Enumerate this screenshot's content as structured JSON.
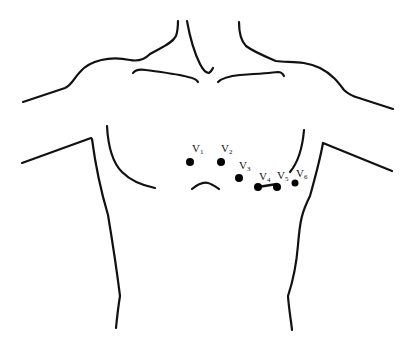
{
  "diagram": {
    "colors": {
      "line": "#111111",
      "electrode": "#000000",
      "background": "#ffffff"
    },
    "electrodes": [
      {
        "id": "V1",
        "letter": "V",
        "sub": "1",
        "x": 190,
        "y": 162,
        "label_x": 193,
        "label_y": 143
      },
      {
        "id": "V2",
        "letter": "V",
        "sub": "2",
        "x": 221,
        "y": 162,
        "label_x": 222,
        "label_y": 143
      },
      {
        "id": "V3",
        "letter": "V",
        "sub": "3",
        "x": 239,
        "y": 178,
        "label_x": 239,
        "label_y": 159
      },
      {
        "id": "V4",
        "letter": "V",
        "sub": "4",
        "x": 258,
        "y": 187,
        "label_x": 258,
        "label_y": 170
      },
      {
        "id": "V5",
        "letter": "V",
        "sub": "5",
        "x": 277,
        "y": 187,
        "label_x": 278,
        "label_y": 170
      },
      {
        "id": "V6",
        "letter": "V",
        "sub": "6",
        "x": 295,
        "y": 183,
        "label_x": 296,
        "label_y": 169
      }
    ],
    "connector": {
      "from": "V4",
      "to": "V5"
    }
  }
}
